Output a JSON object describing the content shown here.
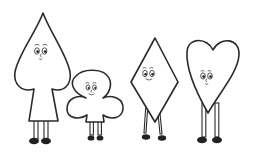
{
  "image": {
    "description": "Four cartoon card-suit characters with faces and legs standing in a row",
    "background": "#ffffff",
    "line_color": "#2a2a2a",
    "characters": [
      {
        "suit": "spade",
        "expression": "neutral"
      },
      {
        "suit": "club",
        "expression": "smiling"
      },
      {
        "suit": "diamond",
        "expression": "smiling"
      },
      {
        "suit": "heart",
        "expression": "neutral"
      }
    ]
  }
}
